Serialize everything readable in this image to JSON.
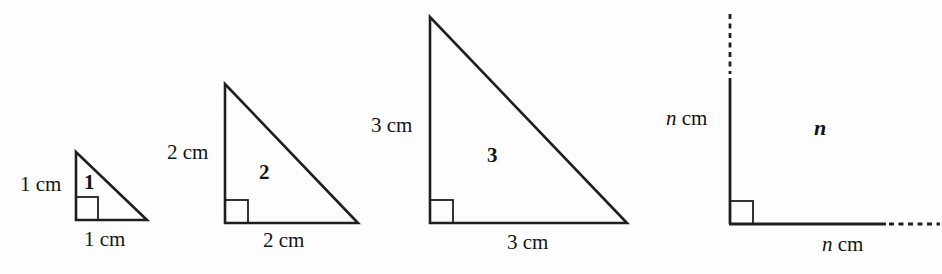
{
  "figures": [
    {
      "name": "triangle-1",
      "number": "1",
      "height_label": {
        "value": "1",
        "unit": "cm"
      },
      "base_label": {
        "value": "1",
        "unit": "cm"
      }
    },
    {
      "name": "triangle-2",
      "number": "2",
      "height_label": {
        "value": "2",
        "unit": "cm"
      },
      "base_label": {
        "value": "2",
        "unit": "cm"
      }
    },
    {
      "name": "triangle-3",
      "number": "3",
      "height_label": {
        "value": "3",
        "unit": "cm"
      },
      "base_label": {
        "value": "3",
        "unit": "cm"
      }
    },
    {
      "name": "figure-n",
      "number": "n",
      "height_label": {
        "value": "n",
        "unit": "cm"
      },
      "base_label": {
        "value": "n",
        "unit": "cm"
      }
    }
  ],
  "colors": {
    "line": "#1e1e1e",
    "text": "#141414",
    "background": "#fdfdfd"
  }
}
